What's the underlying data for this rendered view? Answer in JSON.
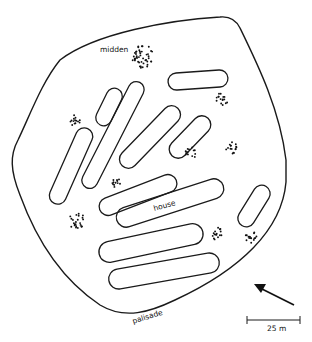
{
  "diagram": {
    "labels": {
      "midden": "midden",
      "house": "house",
      "palisade": "palisade",
      "scale": "25 m"
    },
    "colors": {
      "stroke": "#1a1a1a",
      "background": "#ffffff"
    },
    "houses": [
      {
        "id": "house-1",
        "cx": 198,
        "cy": 80,
        "length": 60,
        "width": 17,
        "angle": -4
      },
      {
        "id": "house-2",
        "cx": 109,
        "cy": 107,
        "length": 40,
        "width": 16,
        "angle": -64
      },
      {
        "id": "house-3",
        "cx": 113,
        "cy": 135,
        "length": 118,
        "width": 16,
        "angle": -63
      },
      {
        "id": "house-4",
        "cx": 71,
        "cy": 166,
        "length": 82,
        "width": 17,
        "angle": -66
      },
      {
        "id": "house-5",
        "cx": 150,
        "cy": 137,
        "length": 80,
        "width": 18,
        "angle": -46
      },
      {
        "id": "house-6",
        "cx": 190,
        "cy": 137,
        "length": 52,
        "width": 18,
        "angle": -46
      },
      {
        "id": "house-7",
        "cx": 138,
        "cy": 195,
        "length": 82,
        "width": 18,
        "angle": -21
      },
      {
        "id": "house-8",
        "cx": 170,
        "cy": 203,
        "length": 112,
        "width": 20,
        "angle": -18,
        "label": "house"
      },
      {
        "id": "house-9",
        "cx": 151,
        "cy": 243,
        "length": 106,
        "width": 21,
        "angle": -12
      },
      {
        "id": "house-10",
        "cx": 164,
        "cy": 271,
        "length": 112,
        "width": 20,
        "angle": -10
      },
      {
        "id": "house-11",
        "cx": 254,
        "cy": 206,
        "length": 46,
        "width": 17,
        "angle": -58
      }
    ],
    "middens": [
      {
        "id": "midden-1",
        "cx": 142,
        "cy": 56,
        "r": 11,
        "n": 46,
        "label": "midden"
      },
      {
        "id": "midden-2",
        "cx": 222,
        "cy": 99,
        "r": 6,
        "n": 16
      },
      {
        "id": "midden-3",
        "cx": 75,
        "cy": 120,
        "r": 5.5,
        "n": 14
      },
      {
        "id": "midden-4",
        "cx": 191,
        "cy": 153,
        "r": 5.5,
        "n": 14
      },
      {
        "id": "midden-5",
        "cx": 232,
        "cy": 148,
        "r": 6,
        "n": 16
      },
      {
        "id": "midden-6",
        "cx": 116,
        "cy": 182,
        "r": 5,
        "n": 12
      },
      {
        "id": "midden-7",
        "cx": 77,
        "cy": 221,
        "r": 8,
        "n": 24
      },
      {
        "id": "midden-8",
        "cx": 218,
        "cy": 234,
        "r": 6,
        "n": 16
      },
      {
        "id": "midden-9",
        "cx": 251,
        "cy": 238,
        "r": 6,
        "n": 16
      }
    ],
    "north_arrow": {
      "x1": 294,
      "y1": 305,
      "x2": 255,
      "y2": 285
    },
    "scale_bar": {
      "x1": 247,
      "x2": 300,
      "y": 320,
      "text": "25 m"
    }
  }
}
